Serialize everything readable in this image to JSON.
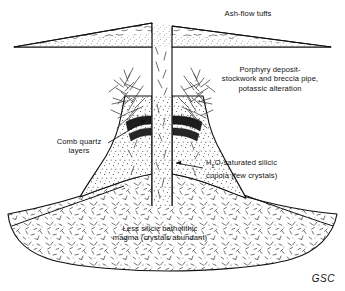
{
  "figure": {
    "kind": "geologic-cross-section",
    "credit": "GSC",
    "background_color": "#ffffff",
    "line_color": "#111111"
  },
  "labels": {
    "ash_flow_tuffs": "Ash-flow tuffs",
    "porphyry_line1": "Porphyry deposit-",
    "porphyry_line2": "stockwork and breccia pipe,",
    "porphyry_line3": "potassic alteration",
    "comb_quartz_line1": "Comb quartz",
    "comb_quartz_line2": "layers",
    "cupola_line1_pre": "H",
    "cupola_line1_sub": "2",
    "cupola_line1_post": "O-saturated silicic",
    "cupola_line2": "cupola (few crystals)",
    "batholith_line1": "Less silicic batholithic",
    "batholith_line2": "magma (crystals abundant)"
  },
  "units": [
    {
      "name": "ash-flow-tuffs",
      "pattern": "shards-and-dots"
    },
    {
      "name": "porphyry-stockwork",
      "pattern": "radiating-veinlets"
    },
    {
      "name": "comb-quartz-layers",
      "pattern": "dark-arcuate-bands"
    },
    {
      "name": "silicic-cupola",
      "pattern": "fine-stipple"
    },
    {
      "name": "batholithic-magma",
      "pattern": "crystal-dashes"
    }
  ]
}
